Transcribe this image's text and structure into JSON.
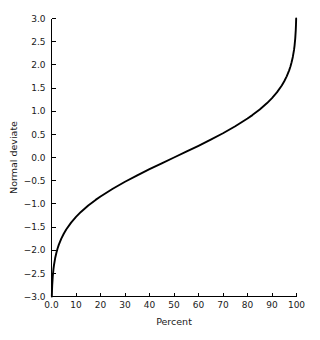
{
  "chart_data": {
    "type": "line",
    "title": "",
    "xlabel": "Percent",
    "ylabel": "Normal deviate",
    "xlim": [
      0,
      100
    ],
    "ylim": [
      -3.0,
      3.0
    ],
    "grid": false,
    "legend": "none",
    "line_color": "#000000",
    "background_color": "#ffffff",
    "axis_color": "#000000",
    "xticks": [
      0,
      10,
      20,
      30,
      40,
      50,
      60,
      70,
      80,
      90,
      100
    ],
    "xtick_labels": [
      "0.0",
      "10",
      "20",
      "30",
      "40",
      "50",
      "60",
      "70",
      "80",
      "90",
      "100"
    ],
    "yticks": [
      -3.0,
      -2.5,
      -2.0,
      -1.5,
      -1.0,
      -0.5,
      0.0,
      0.5,
      1.0,
      1.5,
      2.0,
      2.5,
      3.0
    ],
    "ytick_labels": [
      "−3.0",
      "−2.5",
      "−2.0",
      "−1.5",
      "−1.0",
      "−0.5",
      "0.0",
      "0.5",
      "1.0",
      "1.5",
      "2.0",
      "2.5",
      "3.0"
    ],
    "series": [
      {
        "name": "normal deviate",
        "x": [
          0.135,
          0.2,
          0.3,
          0.5,
          0.8,
          1.0,
          1.5,
          2.0,
          2.5,
          3.0,
          4.0,
          5.0,
          6.0,
          8.0,
          10.0,
          12.0,
          15.0,
          18.0,
          20.0,
          25.0,
          30.0,
          35.0,
          40.0,
          45.0,
          50.0,
          55.0,
          60.0,
          65.0,
          70.0,
          75.0,
          80.0,
          82.0,
          85.0,
          88.0,
          90.0,
          92.0,
          94.0,
          95.0,
          96.0,
          97.0,
          97.5,
          98.0,
          98.5,
          99.0,
          99.2,
          99.5,
          99.7,
          99.8,
          99.865
        ],
        "y": [
          -3.0,
          -2.878,
          -2.748,
          -2.576,
          -2.409,
          -2.326,
          -2.17,
          -2.054,
          -1.96,
          -1.881,
          -1.751,
          -1.645,
          -1.555,
          -1.405,
          -1.282,
          -1.175,
          -1.036,
          -0.915,
          -0.842,
          -0.674,
          -0.524,
          -0.385,
          -0.253,
          -0.126,
          0.0,
          0.126,
          0.253,
          0.385,
          0.524,
          0.674,
          0.842,
          0.915,
          1.036,
          1.175,
          1.282,
          1.405,
          1.555,
          1.645,
          1.751,
          1.881,
          1.96,
          2.054,
          2.17,
          2.326,
          2.409,
          2.576,
          2.748,
          2.878,
          3.0
        ]
      }
    ]
  }
}
